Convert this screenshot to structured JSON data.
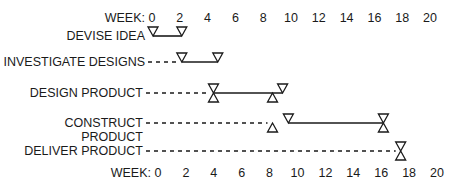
{
  "chart_data": {
    "type": "gantt",
    "title": "",
    "xlabel": "WEEK:",
    "x_ticks": [
      0,
      2,
      4,
      6,
      8,
      10,
      12,
      14,
      16,
      18,
      20
    ],
    "xlim": [
      0,
      20
    ],
    "grid": false,
    "legend": null,
    "tasks": [
      {
        "name": "DEVISE IDEA",
        "lines": [
          "DEVISE IDEA"
        ],
        "start": 0,
        "end": 2,
        "dashed_from": null,
        "markers": [
          {
            "type": "down",
            "week": 0
          },
          {
            "type": "down",
            "week": 2
          }
        ]
      },
      {
        "name": "INVESTIGATE DESIGNS",
        "lines": [
          "INVESTIGATE DESIGNS"
        ],
        "start": 2,
        "end": 4.5,
        "dashed_from": 0,
        "markers": [
          {
            "type": "down",
            "week": 2
          },
          {
            "type": "down",
            "week": 4.5
          }
        ]
      },
      {
        "name": "DESIGN PRODUCT",
        "lines": [
          "DESIGN PRODUCT"
        ],
        "start": 4.2,
        "end": 9,
        "dashed_from": 0,
        "markers": [
          {
            "type": "hourglass",
            "week": 4.2
          },
          {
            "type": "up",
            "week": 8.3
          },
          {
            "type": "down",
            "week": 9
          }
        ]
      },
      {
        "name": "CONSTRUCT PRODUCT",
        "lines": [
          "CONSTRUCT",
          "PRODUCT"
        ],
        "start": 9.4,
        "end": 16,
        "dashed_from": 0,
        "markers": [
          {
            "type": "up",
            "week": 8.3
          },
          {
            "type": "down",
            "week": 9.4
          },
          {
            "type": "hourglass",
            "week": 16
          }
        ]
      },
      {
        "name": "DELIVER PRODUCT",
        "lines": [
          "DELIVER PRODUCT"
        ],
        "start": 17.2,
        "end": 17.2,
        "dashed_from": 0,
        "markers": [
          {
            "type": "hourglass",
            "week": 17.2
          }
        ]
      }
    ]
  },
  "axis": {
    "label": "WEEK:",
    "ticks": [
      "0",
      "2",
      "4",
      "6",
      "8",
      "10",
      "12",
      "14",
      "16",
      "18",
      "20"
    ]
  },
  "colors": {
    "ink": "#1a1a1a",
    "background": "#ffffff"
  }
}
